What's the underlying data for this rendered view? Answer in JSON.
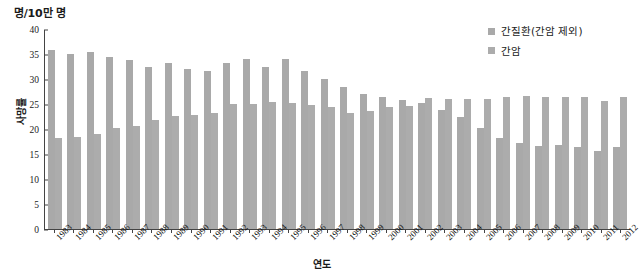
{
  "chart_data": {
    "type": "bar",
    "title": "",
    "unit_label": "명/10만 명",
    "xlabel": "연도",
    "ylabel": "사망률",
    "ylim": [
      0,
      40
    ],
    "ytick_step": 5,
    "yticks": [
      0,
      5,
      10,
      15,
      20,
      25,
      30,
      35,
      40
    ],
    "grid": false,
    "legend_position": "top-right",
    "categories": [
      "1983",
      "1984",
      "1985",
      "1986",
      "1987",
      "1988",
      "1989",
      "1990",
      "1991",
      "1992",
      "1993",
      "1994",
      "1995",
      "1996",
      "1997",
      "1998",
      "1999",
      "2000",
      "2001",
      "2002",
      "2003",
      "2004",
      "2005",
      "2006",
      "2007",
      "2008",
      "2009",
      "2010",
      "2011",
      "2012"
    ],
    "series": [
      {
        "name": "간질환(간암 제외)",
        "color": "#a9a9a9",
        "values": [
          35.8,
          35.0,
          35.4,
          34.5,
          33.9,
          32.4,
          33.3,
          32.1,
          31.7,
          33.2,
          34.1,
          32.5,
          34.1,
          31.6,
          30.1,
          28.4,
          27.1,
          26.4,
          25.9,
          25.3,
          23.9,
          22.4,
          20.3,
          18.3,
          17.3,
          16.7,
          16.8,
          16.5,
          15.7,
          16.5
        ]
      },
      {
        "name": "간암",
        "color": "#acacac",
        "values": [
          18.2,
          18.4,
          19.0,
          20.2,
          20.7,
          21.8,
          22.7,
          22.9,
          23.2,
          25.0,
          25.1,
          25.5,
          25.2,
          24.8,
          24.5,
          23.2,
          23.7,
          24.5,
          24.6,
          26.2,
          26.1,
          26.1,
          26.1,
          26.5,
          26.6,
          26.4,
          26.4,
          26.5,
          25.7,
          26.5
        ]
      }
    ]
  },
  "legend": {
    "items": [
      {
        "label": "간질환(간암 제외)"
      },
      {
        "label": "간암"
      }
    ]
  },
  "colors": {
    "bar_series_1": "#a9a9a9",
    "bar_series_2": "#acacac",
    "axis": "#444444",
    "text": "#1a1a1a",
    "background": "#ffffff"
  }
}
